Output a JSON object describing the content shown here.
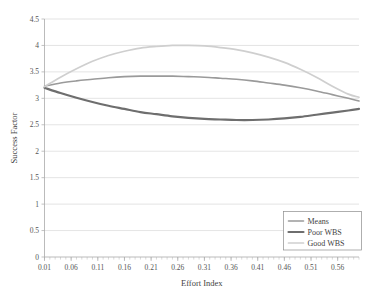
{
  "chart_data": {
    "type": "line",
    "title": "",
    "xlabel": "Effort Index",
    "ylabel": "Success Factor",
    "xlim": [
      0.01,
      0.6
    ],
    "ylim": [
      0,
      4.5
    ],
    "grid": true,
    "legend_position": "bottom-right",
    "x_tick_labels": [
      "0.01",
      "0.06",
      "0.11",
      "0.16",
      "0.21",
      "0.26",
      "0.31",
      "0.36",
      "0.41",
      "0.46",
      "0.51",
      "0.56"
    ],
    "x_tick_values": [
      0.01,
      0.06,
      0.11,
      0.16,
      0.21,
      0.26,
      0.31,
      0.36,
      0.41,
      0.46,
      0.51,
      0.56
    ],
    "x_minor_step": 0.01,
    "y_tick_labels": [
      "0",
      "0.5",
      "1",
      "1.5",
      "2",
      "2.5",
      "3",
      "3.5",
      "4",
      "4.5"
    ],
    "y_tick_values": [
      0,
      0.5,
      1,
      1.5,
      2,
      2.5,
      3,
      3.5,
      4,
      4.5
    ],
    "x": [
      0.01,
      0.04,
      0.07,
      0.1,
      0.13,
      0.16,
      0.19,
      0.22,
      0.25,
      0.28,
      0.31,
      0.34,
      0.37,
      0.4,
      0.43,
      0.46,
      0.49,
      0.52,
      0.55,
      0.58,
      0.6
    ],
    "series": [
      {
        "name": "Means",
        "color": "#9a9a9a",
        "width": 1.6,
        "values": [
          3.23,
          3.29,
          3.33,
          3.36,
          3.39,
          3.41,
          3.42,
          3.42,
          3.42,
          3.41,
          3.4,
          3.38,
          3.36,
          3.33,
          3.29,
          3.25,
          3.2,
          3.14,
          3.07,
          3.0,
          2.95
        ]
      },
      {
        "name": "Poor WBS",
        "color": "#6e6e6e",
        "width": 2.2,
        "values": [
          3.2,
          3.1,
          3.01,
          2.93,
          2.86,
          2.8,
          2.74,
          2.7,
          2.66,
          2.63,
          2.61,
          2.6,
          2.59,
          2.59,
          2.6,
          2.62,
          2.65,
          2.69,
          2.73,
          2.77,
          2.8
        ]
      },
      {
        "name": "Good WBS",
        "color": "#cfcfcf",
        "width": 1.7,
        "values": [
          3.22,
          3.4,
          3.56,
          3.7,
          3.81,
          3.89,
          3.95,
          3.98,
          4.0,
          4.0,
          3.99,
          3.96,
          3.92,
          3.86,
          3.78,
          3.68,
          3.55,
          3.4,
          3.23,
          3.08,
          3.02
        ]
      }
    ]
  },
  "legend": {
    "entries": [
      {
        "label": "Means"
      },
      {
        "label": "Poor WBS"
      },
      {
        "label": "Good WBS"
      }
    ]
  },
  "axes": {
    "x_title": "Effort Index",
    "y_title": "Success Factor"
  }
}
